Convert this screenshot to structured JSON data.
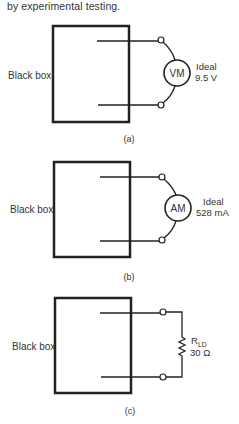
{
  "intro_text": "by experimental testing.",
  "panels": [
    {
      "id": "a",
      "box_label": "Black box",
      "meter_label": "VM",
      "reading_title": "Ideal",
      "reading_value": "9.5 V",
      "caption": "(a)"
    },
    {
      "id": "b",
      "box_label": "Black box",
      "meter_label": "AM",
      "reading_title": "Ideal",
      "reading_value": "528 mA",
      "caption": "(b)"
    },
    {
      "id": "c",
      "box_label": "Black box",
      "resistor_symbol": "R",
      "resistor_subscript": "LD",
      "resistor_value": "30 Ω",
      "caption": "(c)"
    }
  ],
  "colors": {
    "stroke": "#222222",
    "text": "#333333",
    "background": "#ffffff"
  }
}
